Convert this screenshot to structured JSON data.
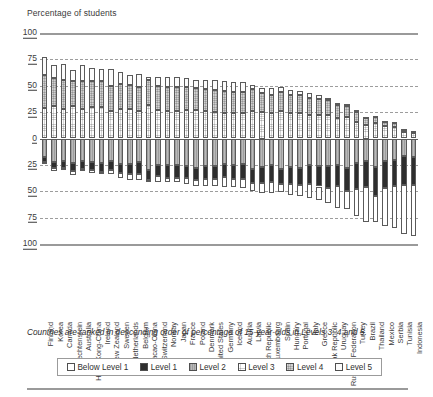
{
  "axis_title": "Percentage of students",
  "footnote": "Countries are ranked in descending order of percentage of 15-year-olds in Levels 3, 4 and 5.",
  "legend": {
    "items": [
      {
        "label": "Below Level 1",
        "color": "#ffffff",
        "swatch": "swatch-below-level-1"
      },
      {
        "label": "Level 1",
        "color": "#2e2e2e",
        "swatch": "swatch-level-1"
      },
      {
        "label": "Level 2",
        "color": "#b0b0b0",
        "swatch": "swatch-level-2"
      },
      {
        "label": "Level 3",
        "color": "#dcdcdc",
        "swatch": "swatch-level-3"
      },
      {
        "label": "Level 4",
        "color": "#cccccc",
        "swatch": "swatch-level-4"
      },
      {
        "label": "Level 5",
        "color": "#fbfbfb",
        "swatch": "swatch-level-5"
      }
    ]
  },
  "y_ticks": [
    "100",
    "75",
    "50",
    "25",
    "0",
    "25",
    "50",
    "75",
    "100"
  ],
  "chart_data": {
    "type": "bar",
    "title": "Percentage of students",
    "subtype": "diverging-stacked-bar",
    "xlabel": "",
    "ylabel": "Percentage of students",
    "ylim": [
      -100,
      100
    ],
    "y_ticks": [
      100,
      75,
      50,
      25,
      0,
      -25,
      -50,
      -75,
      -100
    ],
    "y_tick_labels": [
      "100",
      "75",
      "50",
      "25",
      "0",
      "25",
      "50",
      "75",
      "100"
    ],
    "grid": true,
    "legend_position": "bottom",
    "baseline": 0,
    "above_axis_series": [
      "Level 3",
      "Level 4",
      "Level 5"
    ],
    "below_axis_series": [
      "Level 2",
      "Level 1",
      "Below Level 1"
    ],
    "categories": [
      "Finland",
      "Korea",
      "Canada",
      "Liechtenstein",
      "Australia",
      "Hong Kong-China",
      "Ireland",
      "New Zealand",
      "Sweden",
      "Netherlands",
      "Belgium",
      "Macao-China",
      "Switzerland",
      "Norway",
      "Japan",
      "France",
      "Poland",
      "Denmark",
      "United States",
      "Germany",
      "Iceland",
      "Austria",
      "Latvia",
      "Czech Republic",
      "Luxembourg",
      "Spain",
      "Hungary",
      "Portugal",
      "Italy",
      "Greece",
      "Slovak Republic",
      "Uruguay",
      "Russian Federation",
      "Turkey",
      "Brazil",
      "Thailand",
      "Mexico",
      "Serbia",
      "Tunisia",
      "Indonesia"
    ],
    "series": [
      {
        "name": "Level 5",
        "values": [
          16.7,
          12.2,
          14.7,
          10.2,
          15.0,
          12.9,
          11.7,
          15.9,
          11.3,
          9.5,
          12.0,
          3.0,
          9.2,
          10.2,
          9.9,
          8.5,
          6.9,
          8.1,
          9.3,
          9.6,
          9.1,
          8.8,
          4.0,
          5.0,
          6.7,
          4.9,
          4.5,
          4.2,
          5.2,
          3.7,
          2.2,
          2.6,
          1.7,
          1.5,
          1.1,
          0.5,
          0.5,
          0.4,
          0.1,
          0.1
        ]
      },
      {
        "name": "Level 4",
        "values": [
          31.6,
          26.1,
          27.6,
          24.2,
          25.9,
          24.1,
          24.5,
          24.3,
          23.8,
          23.0,
          22.8,
          23.4,
          22.2,
          22.5,
          22.1,
          21.6,
          21.2,
          20.9,
          20.8,
          20.2,
          20.5,
          20.2,
          20.0,
          18.0,
          17.4,
          18.0,
          17.0,
          17.2,
          16.2,
          15.6,
          14.0,
          12.0,
          11.0,
          9.5,
          7.0,
          6.0,
          5.0,
          4.5,
          2.5,
          1.5
        ]
      },
      {
        "name": "Level 3",
        "values": [
          28.7,
          31.1,
          28.0,
          30.7,
          28.4,
          30.1,
          29.7,
          25.9,
          27.5,
          28.0,
          26.0,
          32.0,
          27.2,
          26.0,
          26.4,
          27.0,
          27.0,
          26.1,
          25.3,
          24.4,
          24.0,
          24.2,
          26.5,
          25.0,
          24.0,
          26.0,
          24.5,
          24.0,
          22.0,
          22.0,
          22.5,
          19.5,
          20.0,
          16.0,
          12.5,
          14.5,
          11.5,
          10.5,
          6.5,
          5.5
        ]
      },
      {
        "name": "Level 2",
        "values": [
          17.4,
          22.0,
          20.9,
          23.1,
          21.5,
          22.1,
          23.0,
          21.3,
          24.0,
          24.0,
          22.5,
          30.0,
          25.0,
          25.5,
          25.0,
          26.0,
          27.5,
          26.0,
          25.6,
          23.9,
          25.0,
          24.5,
          28.5,
          27.0,
          25.5,
          28.5,
          27.0,
          27.5,
          25.5,
          26.0,
          26.5,
          25.0,
          27.5,
          23.5,
          21.5,
          27.0,
          21.5,
          20.5,
          16.5,
          17.5
        ]
      },
      {
        "name": "Level 1",
        "values": [
          4.6,
          6.4,
          6.8,
          8.1,
          7.2,
          8.1,
          8.5,
          8.9,
          9.0,
          9.5,
          11.0,
          9.0,
          11.0,
          11.5,
          12.0,
          11.5,
          12.0,
          12.5,
          12.4,
          13.0,
          13.5,
          13.5,
          13.5,
          15.0,
          15.5,
          14.5,
          16.0,
          16.5,
          18.0,
          19.5,
          20.0,
          20.0,
          22.0,
          24.5,
          24.5,
          27.5,
          25.0,
          24.5,
          27.5,
          27.0
        ]
      },
      {
        "name": "Below Level 1",
        "values": [
          1.0,
          2.2,
          2.0,
          3.7,
          2.0,
          2.7,
          2.6,
          3.7,
          4.4,
          6.0,
          5.7,
          2.6,
          5.4,
          4.3,
          4.6,
          5.4,
          5.4,
          6.4,
          6.6,
          8.9,
          7.9,
          8.8,
          7.5,
          10.0,
          10.9,
          8.1,
          11.0,
          10.6,
          13.1,
          13.2,
          14.8,
          20.9,
          17.8,
          25.0,
          33.4,
          24.5,
          36.5,
          39.6,
          46.9,
          48.4
        ]
      }
    ]
  }
}
